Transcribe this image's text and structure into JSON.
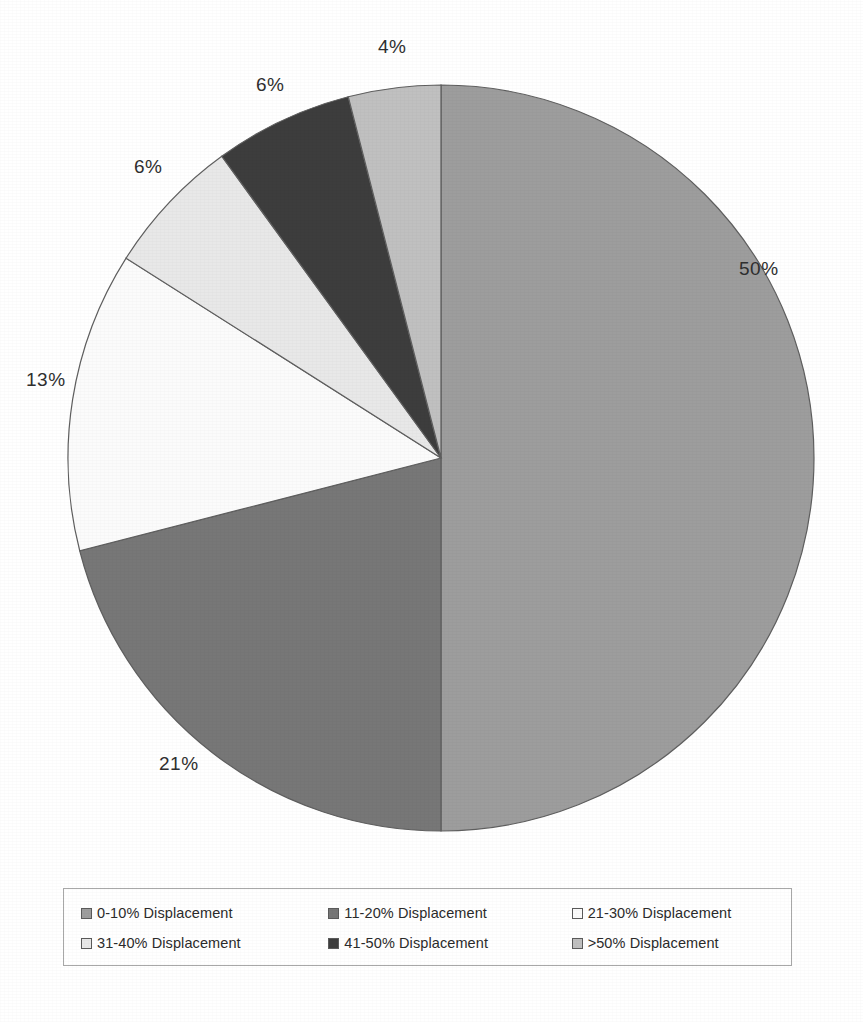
{
  "chart": {
    "title": "",
    "type_label": "pie-chart"
  },
  "chart_data": {
    "type": "pie",
    "title": "",
    "subtitle": "",
    "xlabel": "",
    "ylabel": "",
    "grid": false,
    "legend_position": "bottom",
    "value_unit": "%",
    "categories": [
      "0-10% Displacement",
      "11-20% Displacement",
      "21-30% Displacement",
      "31-40% Displacement",
      "41-50% Displacement",
      ">50% Displacement"
    ],
    "values": [
      50,
      21,
      13,
      6,
      6,
      4
    ],
    "data_labels": [
      "50%",
      "21%",
      "13%",
      "6%",
      "6%",
      "4%"
    ],
    "colors": [
      "#9d9d9d",
      "#777777",
      "#fbfbfb",
      "#e8e8e8",
      "#3d3d3d",
      "#c0c0c0"
    ],
    "slice_order": "clockwise from 12 o'clock",
    "total": 100
  },
  "labels": {
    "items": [
      {
        "text": "50%"
      },
      {
        "text": "21%"
      },
      {
        "text": "13%"
      },
      {
        "text": "6%"
      },
      {
        "text": "6%"
      },
      {
        "text": "4%"
      }
    ]
  },
  "legend": {
    "rows": [
      [
        {
          "label": "0-10% Displacement",
          "color": "#9d9d9d"
        },
        {
          "label": "11-20% Displacement",
          "color": "#777777"
        },
        {
          "label": "21-30% Displacement",
          "color": "#fbfbfb"
        }
      ],
      [
        {
          "label": "31-40% Displacement",
          "color": "#e8e8e8"
        },
        {
          "label": "41-50% Displacement",
          "color": "#3d3d3d"
        },
        {
          "label": ">50% Displacement",
          "color": "#c0c0c0"
        }
      ]
    ]
  }
}
